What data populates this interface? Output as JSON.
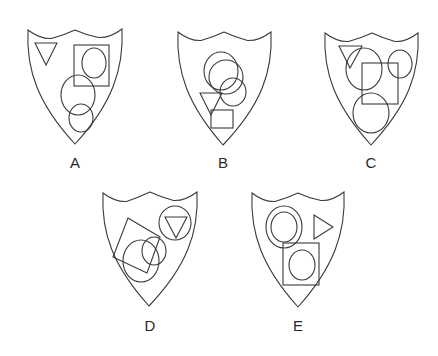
{
  "diagram": {
    "type": "shield-options-puzzle",
    "stroke_color": "#3a3a3a",
    "background": "#ffffff",
    "options": [
      {
        "id": "A",
        "label": "A",
        "label_pos": [
          75,
          168
        ],
        "shield": {
          "tl": [
            28,
            30
          ],
          "peak": [
            75,
            30
          ],
          "tr": [
            122,
            29
          ],
          "tip": [
            75,
            144
          ]
        },
        "shapes": [
          {
            "kind": "triangle",
            "direction": "down",
            "points": [
              [
                35,
                43
              ],
              [
                57,
                43
              ],
              [
                46,
                65
              ]
            ]
          },
          {
            "kind": "square",
            "x": 74,
            "y": 45,
            "w": 35,
            "h": 41
          },
          {
            "kind": "circle",
            "cx": 94,
            "cy": 63,
            "rx": 12,
            "ry": 15
          },
          {
            "kind": "circle",
            "cx": 78,
            "cy": 95,
            "rx": 17,
            "ry": 20
          },
          {
            "kind": "circle",
            "cx": 81,
            "cy": 118,
            "rx": 12,
            "ry": 14
          }
        ]
      },
      {
        "id": "B",
        "label": "B",
        "label_pos": [
          223,
          168
        ],
        "shield": {
          "tl": [
            178,
            32
          ],
          "peak": [
            224,
            32
          ],
          "tr": [
            271,
            32
          ],
          "tip": [
            223,
            145
          ]
        },
        "shapes": [
          {
            "kind": "circle",
            "cx": 221,
            "cy": 71,
            "rx": 17,
            "ry": 19
          },
          {
            "kind": "circle",
            "cx": 226,
            "cy": 77,
            "rx": 17,
            "ry": 17
          },
          {
            "kind": "circle",
            "cx": 233,
            "cy": 92,
            "rx": 13,
            "ry": 14
          },
          {
            "kind": "triangle",
            "direction": "down",
            "points": [
              [
                200,
                93
              ],
              [
                222,
                93
              ],
              [
                211,
                115
              ]
            ]
          },
          {
            "kind": "square",
            "x": 211,
            "y": 110,
            "w": 22,
            "h": 18
          }
        ]
      },
      {
        "id": "C",
        "label": "C",
        "label_pos": [
          371,
          168
        ],
        "shield": {
          "tl": [
            325,
            33
          ],
          "peak": [
            372,
            33
          ],
          "tr": [
            418,
            33
          ],
          "tip": [
            371,
            145
          ]
        },
        "shapes": [
          {
            "kind": "triangle",
            "direction": "down",
            "points": [
              [
                339,
                46
              ],
              [
                362,
                46
              ],
              [
                350,
                68
              ]
            ]
          },
          {
            "kind": "circle",
            "cx": 364,
            "cy": 69,
            "rx": 18,
            "ry": 21
          },
          {
            "kind": "circle",
            "cx": 400,
            "cy": 64,
            "rx": 12,
            "ry": 14
          },
          {
            "kind": "square",
            "x": 362,
            "y": 63,
            "w": 36,
            "h": 41
          },
          {
            "kind": "circle",
            "cx": 371,
            "cy": 113,
            "rx": 18,
            "ry": 20
          }
        ]
      },
      {
        "id": "D",
        "label": "D",
        "label_pos": [
          150,
          331
        ],
        "shield": {
          "tl": [
            103,
            193
          ],
          "peak": [
            150,
            192
          ],
          "tr": [
            197,
            192
          ],
          "tip": [
            149,
            306
          ]
        },
        "shapes": [
          {
            "kind": "polygon",
            "name": "rotated-square",
            "points": [
              [
                128,
                218
              ],
              [
                160,
                237
              ],
              [
                147,
                273
              ],
              [
                113,
                257
              ]
            ]
          },
          {
            "kind": "circle",
            "cx": 141,
            "cy": 261,
            "rx": 18,
            "ry": 21
          },
          {
            "kind": "circle",
            "cx": 154,
            "cy": 251,
            "rx": 12,
            "ry": 14
          },
          {
            "kind": "circle",
            "cx": 175,
            "cy": 223,
            "rx": 16,
            "ry": 17
          },
          {
            "kind": "triangle",
            "direction": "down",
            "points": [
              [
                165,
                217
              ],
              [
                187,
                217
              ],
              [
                176,
                238
              ]
            ]
          }
        ]
      },
      {
        "id": "E",
        "label": "E",
        "label_pos": [
          298,
          331
        ],
        "shield": {
          "tl": [
            252,
            193
          ],
          "peak": [
            298,
            193
          ],
          "tr": [
            344,
            192
          ],
          "tip": [
            298,
            307
          ]
        },
        "shapes": [
          {
            "kind": "circle",
            "cx": 284,
            "cy": 227,
            "rx": 18,
            "ry": 21
          },
          {
            "kind": "circle",
            "cx": 284,
            "cy": 227,
            "rx": 13,
            "ry": 15
          },
          {
            "kind": "triangle",
            "direction": "right",
            "points": [
              [
                314,
                215
              ],
              [
                314,
                239
              ],
              [
                333,
                227
              ]
            ]
          },
          {
            "kind": "square",
            "x": 283,
            "y": 243,
            "w": 36,
            "h": 42
          },
          {
            "kind": "circle",
            "cx": 302,
            "cy": 265,
            "rx": 13,
            "ry": 15
          }
        ]
      }
    ]
  }
}
